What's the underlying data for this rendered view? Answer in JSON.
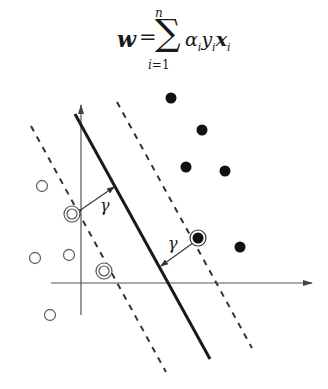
{
  "formula": {
    "lhs": "w",
    "equals": "=",
    "sum_symbol": "∑",
    "upper_limit": "n",
    "lower_limit": "i=1",
    "alpha": "α",
    "y": "y",
    "x": "x",
    "subscript": "i",
    "latex": "\\boldsymbol{w} = \\sum_{i=1}^{n} \\alpha_i y_i \\boldsymbol{x}_i"
  },
  "diagram": {
    "margin_label_left": "γ",
    "margin_label_right": "γ",
    "colors": {
      "line": "#1a1a1a",
      "axis": "#555555",
      "dashed": "#333333",
      "filled_point": "#111111",
      "open_point": "#666666"
    },
    "axes": {
      "x_axis": {
        "x1": 51,
        "y1": 283,
        "x2": 312,
        "y2": 283
      },
      "y_axis": {
        "x1": 81,
        "y1": 315,
        "x2": 81,
        "y2": 105
      }
    },
    "hyperplane": {
      "x1": 75,
      "y1": 114,
      "x2": 210,
      "y2": 359
    },
    "margin_lines": [
      {
        "name": "negative-margin",
        "x1": 31,
        "y1": 126,
        "x2": 166,
        "y2": 372
      },
      {
        "name": "positive-margin",
        "x1": 117,
        "y1": 102,
        "x2": 252,
        "y2": 348
      }
    ],
    "margin_arrows": [
      {
        "name": "left-margin-arrow",
        "x1": 82,
        "y1": 209,
        "x2": 114,
        "y2": 187,
        "label_x": 100,
        "label_y": 211
      },
      {
        "name": "right-margin-arrow",
        "x1": 193,
        "y1": 243,
        "x2": 161,
        "y2": 266,
        "label_x": 168,
        "label_y": 249
      }
    ],
    "positive_points": [
      {
        "x": 171,
        "y": 98
      },
      {
        "x": 202,
        "y": 130
      },
      {
        "x": 186,
        "y": 167
      },
      {
        "x": 225,
        "y": 171
      },
      {
        "x": 240,
        "y": 247
      }
    ],
    "negative_points": [
      {
        "x": 42,
        "y": 186
      },
      {
        "x": 35,
        "y": 258
      },
      {
        "x": 69,
        "y": 255
      },
      {
        "x": 50,
        "y": 315
      }
    ],
    "support_vectors": [
      {
        "class": "negative",
        "x": 72,
        "y": 214
      },
      {
        "class": "negative",
        "x": 104,
        "y": 271
      },
      {
        "class": "positive",
        "x": 198,
        "y": 238
      }
    ]
  }
}
